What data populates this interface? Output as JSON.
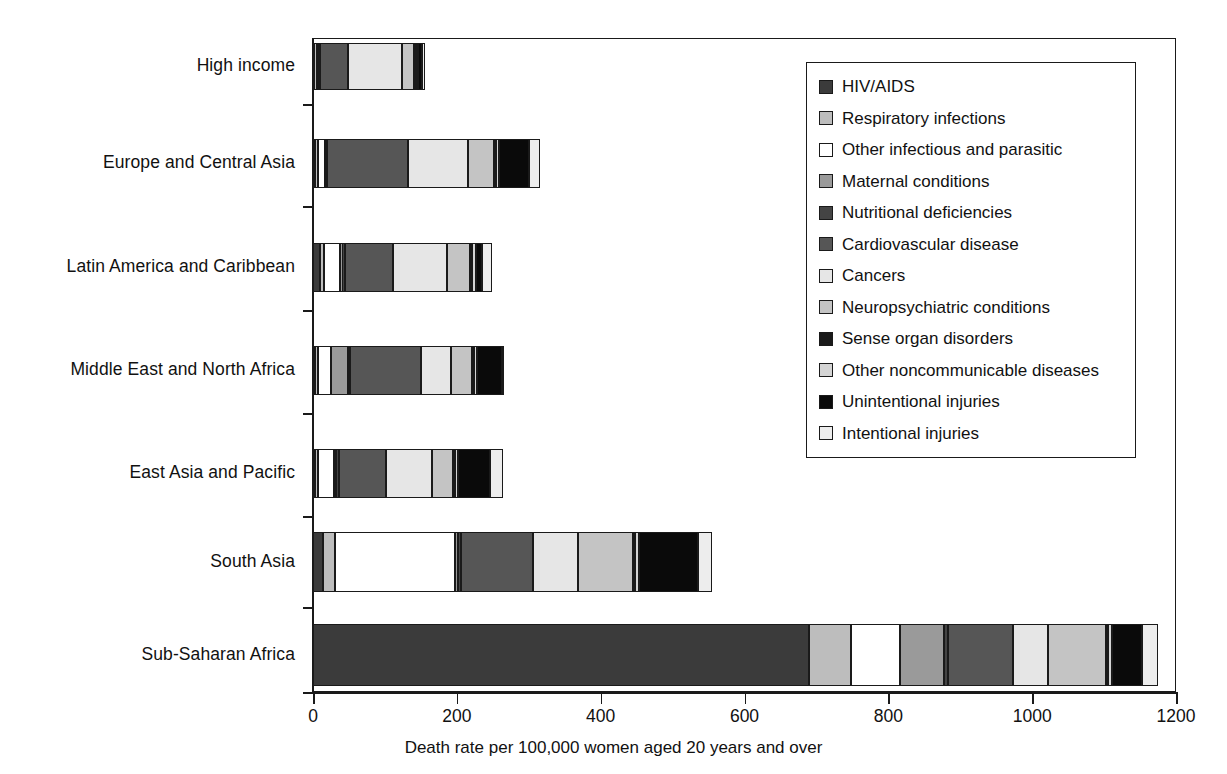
{
  "chart_data": {
    "type": "bar",
    "orientation": "horizontal",
    "stacked": true,
    "title": "",
    "xlabel": "Death rate per 100,000 women aged 20 years and over",
    "ylabel": "",
    "xlim": [
      0,
      1200
    ],
    "xticks": [
      0,
      200,
      400,
      600,
      800,
      1000,
      1200
    ],
    "xtick_labels": [
      "0",
      "200",
      "400",
      "600",
      "800",
      "1000",
      "1200"
    ],
    "grid": false,
    "legend_position": "upper right inside",
    "categories": [
      "High income",
      "Europe and Central Asia",
      "Latin America and Caribbean",
      "Middle East and North Africa",
      "East Asia and Pacific",
      "South Asia",
      "Sub-Saharan Africa"
    ],
    "series": [
      {
        "name": "HIV/AIDS",
        "color": "#3b3b3b",
        "values": [
          2,
          3,
          10,
          3,
          3,
          14,
          690
        ]
      },
      {
        "name": "Respiratory infections",
        "color": "#bdbdbd",
        "values": [
          3,
          4,
          5,
          4,
          4,
          16,
          58
        ]
      },
      {
        "name": "Other infectious and parasitic",
        "color": "#ffffff",
        "values": [
          3,
          9,
          23,
          18,
          22,
          168,
          68
        ]
      },
      {
        "name": "Maternal conditions",
        "color": "#9a9a9a",
        "values": [
          1,
          2,
          3,
          24,
          3,
          4,
          62
        ]
      },
      {
        "name": "Nutritional deficiencies",
        "color": "#444444",
        "values": [
          1,
          2,
          3,
          3,
          4,
          4,
          5
        ]
      },
      {
        "name": "Cardiovascular disease",
        "color": "#565656",
        "values": [
          38,
          112,
          67,
          98,
          66,
          100,
          90
        ]
      },
      {
        "name": "Cancers",
        "color": "#e6e6e6",
        "values": [
          76,
          83,
          75,
          42,
          63,
          63,
          49
        ]
      },
      {
        "name": "Neuropsychiatric conditions",
        "color": "#c4c4c4",
        "values": [
          17,
          37,
          33,
          29,
          30,
          76,
          80
        ]
      },
      {
        "name": "Sense organ disorders",
        "color": "#1a1a1a",
        "values": [
          2,
          3,
          2,
          3,
          3,
          3,
          3
        ]
      },
      {
        "name": "Other noncommunicable diseases",
        "color": "#d4d4d4",
        "values": [
          3,
          4,
          5,
          4,
          4,
          5,
          6
        ]
      },
      {
        "name": "Unintentional injuries",
        "color": "#0a0a0a",
        "values": [
          6,
          42,
          9,
          35,
          44,
          83,
          42
        ]
      },
      {
        "name": "Intentional injuries",
        "color": "#ededed",
        "values": [
          3,
          14,
          14,
          3,
          18,
          19,
          22
        ]
      }
    ],
    "totals": [
      155,
      315,
      249,
      266,
      264,
      555,
      1175
    ]
  },
  "legend": {
    "items": [
      {
        "label": "HIV/AIDS"
      },
      {
        "label": "Respiratory infections"
      },
      {
        "label": "Other infectious and parasitic"
      },
      {
        "label": "Maternal conditions"
      },
      {
        "label": "Nutritional deficiencies"
      },
      {
        "label": "Cardiovascular disease"
      },
      {
        "label": "Cancers"
      },
      {
        "label": "Neuropsychiatric conditions"
      },
      {
        "label": "Sense organ disorders"
      },
      {
        "label": "Other noncommunicable diseases"
      },
      {
        "label": "Unintentional injuries"
      },
      {
        "label": "Intentional injuries"
      }
    ]
  },
  "axis": {
    "x_title": "Death rate per 100,000 women aged 20 years and over"
  }
}
